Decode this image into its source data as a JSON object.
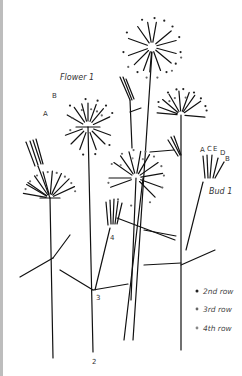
{
  "diagram": {
    "labels": {
      "flower1": "Flower 1",
      "bud1": "Bud 1",
      "flower_A": "A",
      "flower_B": "B",
      "bud_A": "A",
      "bud_C": "C",
      "bud_E": "E",
      "bud_D": "D",
      "bud_B": "B",
      "num4": "4",
      "num3": "3",
      "num2": "2"
    },
    "legend": [
      {
        "label": "2nd row",
        "color": "#222222"
      },
      {
        "label": "3rd row",
        "color": "#666666"
      },
      {
        "label": "4th row",
        "color": "#888888"
      }
    ]
  }
}
